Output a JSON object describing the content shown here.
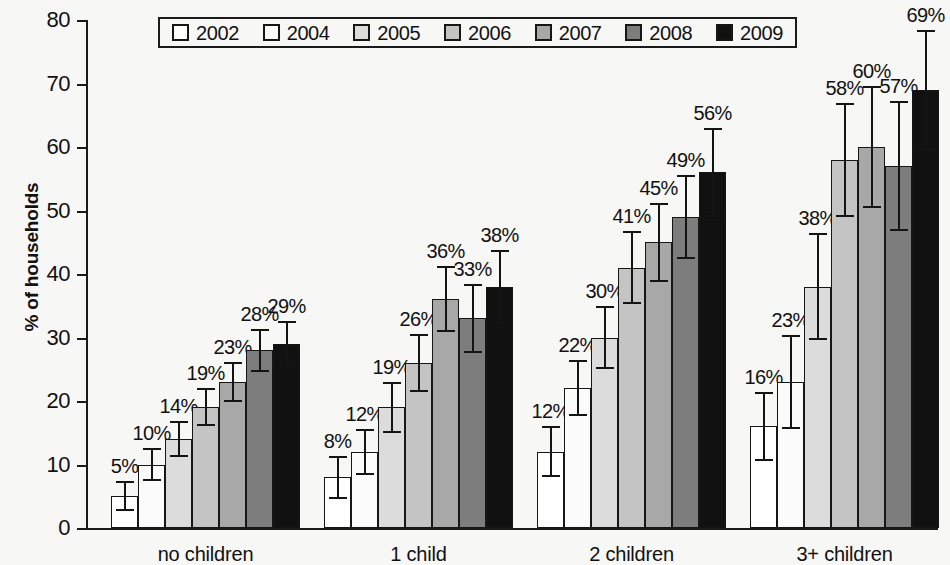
{
  "chart_data": {
    "type": "bar",
    "title": "",
    "subtitle": "",
    "xlabel": "",
    "ylabel": "% of households",
    "ylim": [
      0,
      80
    ],
    "ytick_step": 10,
    "yticks": [
      "80",
      "70",
      "60",
      "50",
      "40",
      "30",
      "20",
      "10",
      "0"
    ],
    "grid": false,
    "legend_position": "top",
    "categories": [
      "no children",
      "1 child",
      "2 children",
      "3+ children"
    ],
    "series": [
      {
        "name": "2002",
        "color": "#ffffff",
        "values": [
          5,
          8,
          12,
          16
        ],
        "labels": [
          "5%",
          "8%",
          "12%",
          "16%"
        ],
        "err_low": [
          2.4,
          3.4,
          4.0,
          5.4
        ],
        "err_high": [
          2.4,
          3.4,
          4.0,
          5.4
        ]
      },
      {
        "name": "2004",
        "color": "#fbfbfb",
        "values": [
          10,
          12,
          22,
          23
        ],
        "labels": [
          "10%",
          "12%",
          "22%",
          "23%"
        ],
        "err_low": [
          2.6,
          3.6,
          4.4,
          7.4
        ],
        "err_high": [
          2.6,
          3.6,
          4.4,
          7.4
        ]
      },
      {
        "name": "2005",
        "color": "#dcdcdc",
        "values": [
          14,
          19,
          30,
          38
        ],
        "labels": [
          "14%",
          "19%",
          "30%",
          "38%"
        ],
        "err_low": [
          2.8,
          4.0,
          5.0,
          8.4
        ],
        "err_high": [
          2.8,
          4.0,
          5.0,
          8.4
        ]
      },
      {
        "name": "2006",
        "color": "#c4c4c4",
        "values": [
          19,
          26,
          41,
          58
        ],
        "labels": [
          "19%",
          "26%",
          "41%",
          "58%"
        ],
        "err_low": [
          3.0,
          4.6,
          5.8,
          9.0
        ],
        "err_high": [
          3.0,
          4.6,
          5.8,
          9.0
        ]
      },
      {
        "name": "2007",
        "color": "#a8a8a8",
        "values": [
          23,
          36,
          45,
          60
        ],
        "labels": [
          "23%",
          "36%",
          "45%",
          "60%"
        ],
        "err_low": [
          3.2,
          5.2,
          6.2,
          9.6
        ],
        "err_high": [
          3.2,
          5.2,
          6.2,
          9.6
        ]
      },
      {
        "name": "2008",
        "color": "#7d7d7d",
        "values": [
          28,
          33,
          49,
          57
        ],
        "labels": [
          "28%",
          "33%",
          "49%",
          "57%"
        ],
        "err_low": [
          3.4,
          5.4,
          6.6,
          10.2
        ],
        "err_high": [
          3.4,
          5.4,
          6.6,
          10.2
        ]
      },
      {
        "name": "2009",
        "color": "#111111",
        "values": [
          29,
          38,
          56,
          69
        ],
        "labels": [
          "29%",
          "38%",
          "56%",
          "69%"
        ],
        "err_low": [
          3.6,
          5.8,
          7.0,
          9.5
        ],
        "err_high": [
          3.6,
          5.8,
          7.0,
          9.5
        ]
      }
    ]
  }
}
